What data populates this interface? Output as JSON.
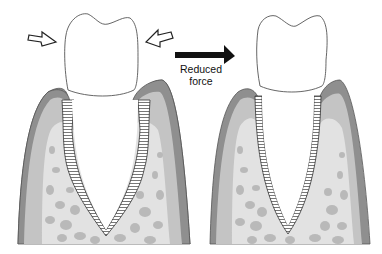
{
  "figure": {
    "type": "periodontal diagram",
    "panels": [
      {
        "id": "left",
        "description": "Tooth with widened periodontal ligament under excessive bilateral force",
        "force_arrows": [
          "hollow-arrow-right",
          "hollow-arrow-left"
        ]
      },
      {
        "id": "right",
        "description": "Tooth with normal periodontal ligament after reduced force",
        "force_arrows": []
      }
    ],
    "transition_arrow": {
      "icon": "solid-arrow-right",
      "label_line1": "Reduced",
      "label_line2": "force"
    },
    "colors": {
      "background": "#ffffff",
      "gingiva_outer": "#8f8f8f",
      "gingiva_inner": "#c4c4c4",
      "bone": "#e2e2e2",
      "trabeculae": "#b9b9b9",
      "ligament": "#ffffff",
      "outline": "#444444",
      "arrow": "#111111"
    }
  }
}
